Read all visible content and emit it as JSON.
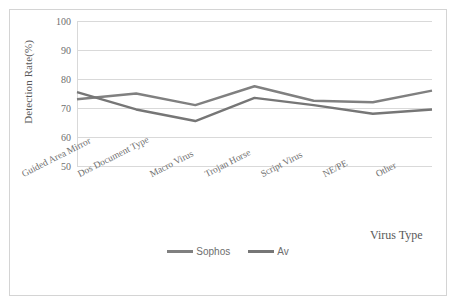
{
  "chart_data": {
    "type": "line",
    "title": "",
    "xlabel": "Virus Type",
    "ylabel": "Detection Rate(%)",
    "categories": [
      "Guided Area Mirror",
      "Dos Document Type",
      "Macro Virus",
      "Trojan Horse",
      "Script Virus",
      "NE/PE",
      "Other"
    ],
    "series": [
      {
        "name": "Sophos",
        "color": "#808080",
        "values": [
          73,
          75,
          71,
          77.5,
          72.5,
          72,
          76
        ]
      },
      {
        "name": "Av",
        "color": "#767676",
        "values": [
          75.5,
          69.5,
          65.5,
          73.5,
          71,
          68,
          69.5
        ]
      }
    ],
    "ylim": [
      50,
      100
    ],
    "yticks": [
      50,
      60,
      70,
      80,
      90,
      100
    ],
    "ytick_labels": [
      "50",
      "60",
      "70",
      "80",
      "90",
      "100"
    ],
    "grid": true,
    "legend_position": "bottom"
  },
  "axes": {
    "y_label": "Detection Rate(%)",
    "x_label": "Virus Type",
    "tick_50": "50",
    "tick_60": "60",
    "tick_70": "70",
    "tick_80": "80",
    "tick_90": "90",
    "tick_100": "100"
  },
  "categories": {
    "c0": "Guided Area Mirror",
    "c1": "Dos Document Type",
    "c2": "Macro Virus",
    "c3": "Trojan Horse",
    "c4": "Script Virus",
    "c5": "NE/PE",
    "c6": "Other"
  },
  "legend": {
    "series_1": "Sophos",
    "series_2": "Av"
  },
  "colors": {
    "series_1": "#808080",
    "series_2": "#767676",
    "grid": "#d9d9d9",
    "frame": "#d4d4d4",
    "text": "#6e6e6e"
  }
}
